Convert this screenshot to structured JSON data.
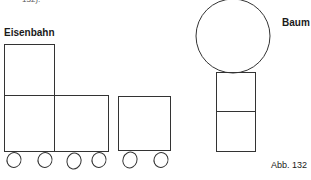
{
  "top_fragment": "132).",
  "train": {
    "label": "Eisenbahn",
    "locomotive": {
      "cab": "upper-square",
      "body": "two-lower-squares"
    },
    "wagon": {
      "body": "one-square"
    },
    "wheel_count": 6
  },
  "tree": {
    "label": "Baum",
    "crown": "circle",
    "trunk": "two-stacked-squares"
  },
  "caption": "Abb. 132",
  "colors": {
    "stroke": "#333333",
    "background": "#ffffff"
  }
}
